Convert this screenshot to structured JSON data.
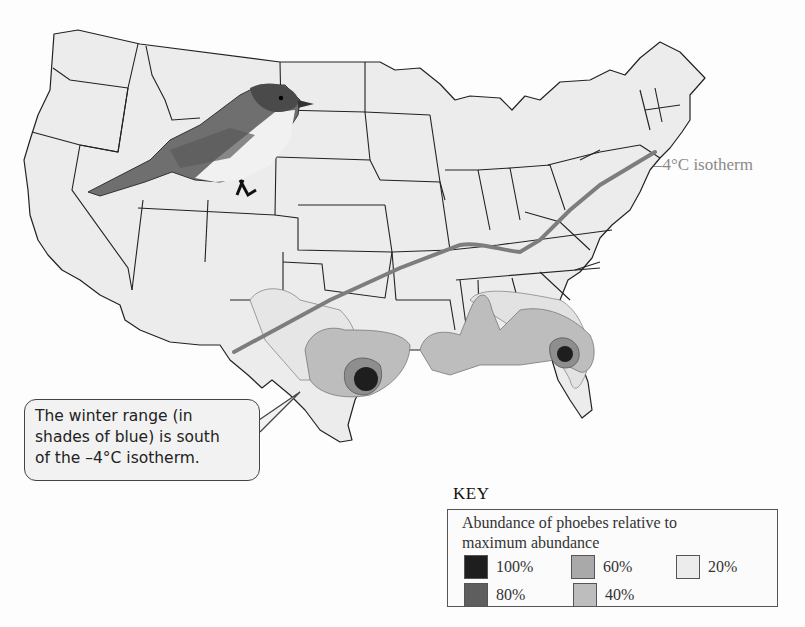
{
  "figure": {
    "isotherm_label": "–4°C isotherm",
    "isotherm_color": "#7d7d7d"
  },
  "callout": {
    "lines": [
      "The winter range (in",
      "shades of blue) is south",
      "of the –4°C isotherm."
    ]
  },
  "key": {
    "title": "KEY",
    "description_lines": [
      "Abundance of phoebes relative to",
      "maximum abundance"
    ],
    "items": [
      {
        "label": "100%",
        "color": "#1e1e1e"
      },
      {
        "label": "80%",
        "color": "#5e5e5e"
      },
      {
        "label": "60%",
        "color": "#a9a9a9"
      },
      {
        "label": "40%",
        "color": "#bdbdbd"
      },
      {
        "label": "20%",
        "color": "#ececec"
      }
    ]
  },
  "colors": {
    "land": "#ececec",
    "state_border": "#222222",
    "background": "#fdfdfd"
  }
}
